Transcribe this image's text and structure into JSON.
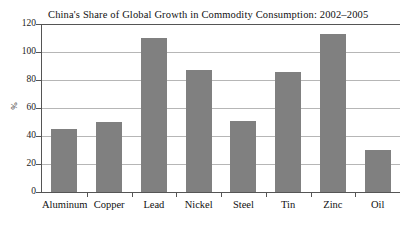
{
  "chart_data": {
    "type": "bar",
    "title": "China's Share of Global Growth in Commodity Consumption: 2002–2005",
    "xlabel": "",
    "ylabel": "%",
    "categories": [
      "Aluminum",
      "Copper",
      "Lead",
      "Nickel",
      "Steel",
      "Tin",
      "Zinc",
      "Oil"
    ],
    "values": [
      45,
      50,
      110,
      87,
      51,
      86,
      113,
      30
    ],
    "ylim": [
      0,
      120
    ],
    "ytick_values": [
      0,
      20,
      40,
      60,
      80,
      100,
      120
    ],
    "ytick_labels": [
      "0",
      "20",
      "40",
      "60",
      "80",
      "100",
      "120"
    ],
    "grid": true,
    "legend": false,
    "bar_color": "#808080",
    "gridline_color": "#b6b6b6",
    "axis_color": "#555555"
  }
}
